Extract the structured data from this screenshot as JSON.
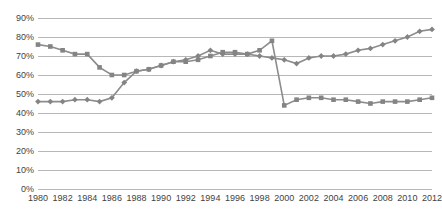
{
  "chart_data": {
    "type": "line",
    "title": "",
    "subtitle": "",
    "xlabel": "",
    "ylabel": "",
    "grid": true,
    "legend_position": "none",
    "ylim": [
      0,
      90
    ],
    "ytick_labels": [
      "90%",
      "80%",
      "70%",
      "60%",
      "50%",
      "40%",
      "30%",
      "20%",
      "10%",
      "0%"
    ],
    "ytick_values": [
      90,
      80,
      70,
      60,
      50,
      40,
      30,
      20,
      10,
      0
    ],
    "xtick_labels": [
      "1980",
      "1982",
      "1984",
      "1986",
      "1988",
      "1990",
      "1992",
      "1994",
      "1996",
      "1998",
      "2000",
      "2002",
      "2004",
      "2006",
      "2008",
      "2010",
      "2012"
    ],
    "xtick_values": [
      1980,
      1982,
      1984,
      1986,
      1988,
      1990,
      1992,
      1994,
      1996,
      1998,
      2000,
      2002,
      2004,
      2006,
      2008,
      2010,
      2012
    ],
    "xlim": [
      1980,
      2012
    ],
    "x": [
      1980,
      1981,
      1982,
      1983,
      1984,
      1985,
      1986,
      1987,
      1988,
      1989,
      1990,
      1991,
      1992,
      1993,
      1994,
      1995,
      1996,
      1997,
      1998,
      1999,
      2000,
      2001,
      2002,
      2003,
      2004,
      2005,
      2006,
      2007,
      2008,
      2009,
      2010,
      2011,
      2012
    ],
    "series": [
      {
        "name": "series-diamond",
        "marker": "diamond",
        "color": "#848484",
        "values": [
          46,
          46,
          46,
          47,
          47,
          46,
          48,
          56,
          62,
          63,
          65,
          67,
          68,
          70,
          73,
          71,
          71,
          71,
          70,
          69,
          68,
          66,
          69,
          70,
          70,
          71,
          73,
          74,
          76,
          78,
          80,
          83,
          84
        ]
      },
      {
        "name": "series-square",
        "marker": "square",
        "color": "#848484",
        "values": [
          76,
          75,
          73,
          71,
          71,
          64,
          60,
          60,
          62,
          63,
          65,
          67,
          67,
          68,
          70,
          72,
          72,
          71,
          73,
          78,
          44,
          47,
          48,
          48,
          47,
          47,
          46,
          45,
          46,
          46,
          46,
          47,
          48
        ]
      }
    ]
  }
}
